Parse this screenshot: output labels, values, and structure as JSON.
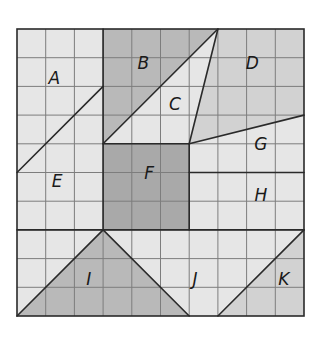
{
  "figure": {
    "grid": {
      "cols": 10,
      "rows": 10,
      "origin_px": [
        17,
        29
      ],
      "cell_px": 28.7
    },
    "colors": {
      "background": "#ffffff",
      "light": "#e6e6e6",
      "medium": "#d2d2d2",
      "dark": "#b9b9b9",
      "darkest": "#a9a9a9",
      "gridline": "#7d7d7d",
      "boundary": "#2a2a2a"
    },
    "regions": [
      {
        "label": "A",
        "shade": "light",
        "points": [
          [
            0,
            0
          ],
          [
            3,
            0
          ],
          [
            3,
            2
          ],
          [
            0,
            5
          ]
        ],
        "label_pos": [
          1.3,
          1.7
        ]
      },
      {
        "label": "B",
        "shade": "dark",
        "points": [
          [
            3,
            0
          ],
          [
            7,
            0
          ],
          [
            3,
            4
          ]
        ],
        "label_pos": [
          4.4,
          1.2
        ]
      },
      {
        "label": "C",
        "shade": "light",
        "points": [
          [
            7,
            0
          ],
          [
            6,
            4
          ],
          [
            3,
            4
          ]
        ],
        "label_pos": [
          5.5,
          2.6
        ]
      },
      {
        "label": "D",
        "shade": "medium",
        "points": [
          [
            7,
            0
          ],
          [
            10,
            0
          ],
          [
            10,
            3
          ],
          [
            6,
            4
          ]
        ],
        "label_pos": [
          8.2,
          1.2
        ]
      },
      {
        "label": "E",
        "shade": "light",
        "points": [
          [
            0,
            5
          ],
          [
            3,
            2
          ],
          [
            3,
            7
          ],
          [
            0,
            7
          ]
        ],
        "label_pos": [
          1.4,
          5.3
        ]
      },
      {
        "label": "F",
        "shade": "darkest",
        "points": [
          [
            3,
            4
          ],
          [
            6,
            4
          ],
          [
            6,
            7
          ],
          [
            3,
            7
          ]
        ],
        "label_pos": [
          4.6,
          5.0
        ]
      },
      {
        "label": "G",
        "shade": "light",
        "points": [
          [
            6,
            4
          ],
          [
            10,
            3
          ],
          [
            10,
            5
          ],
          [
            6,
            5
          ]
        ],
        "label_pos": [
          8.5,
          4.0
        ]
      },
      {
        "label": "H",
        "shade": "light",
        "points": [
          [
            6,
            5
          ],
          [
            10,
            5
          ],
          [
            10,
            7
          ],
          [
            6,
            7
          ]
        ],
        "label_pos": [
          8.5,
          5.8
        ]
      },
      {
        "label": "I",
        "shade": "dark",
        "points": [
          [
            0,
            10
          ],
          [
            3,
            7
          ],
          [
            6,
            10
          ]
        ],
        "label_pos": [
          2.5,
          8.7
        ]
      },
      {
        "label": "J",
        "shade": "light",
        "points": [
          [
            0,
            7
          ],
          [
            10,
            7
          ],
          [
            7,
            10
          ],
          [
            6,
            10
          ],
          [
            3,
            7
          ],
          [
            0,
            10
          ]
        ],
        "label_pos": [
          6.2,
          8.7
        ]
      },
      {
        "label": "K",
        "shade": "medium",
        "points": [
          [
            10,
            7
          ],
          [
            10,
            10
          ],
          [
            7,
            10
          ]
        ],
        "label_pos": [
          9.3,
          8.7
        ]
      }
    ],
    "boundary_lines": [
      [
        [
          0,
          5
        ],
        [
          3,
          2
        ]
      ],
      [
        [
          3,
          4
        ],
        [
          7,
          0
        ]
      ],
      [
        [
          7,
          0
        ],
        [
          6,
          4
        ]
      ],
      [
        [
          6,
          4
        ],
        [
          10,
          3
        ]
      ],
      [
        [
          3,
          0
        ],
        [
          3,
          7
        ]
      ],
      [
        [
          3,
          4
        ],
        [
          6,
          4
        ]
      ],
      [
        [
          6,
          4
        ],
        [
          6,
          7
        ]
      ],
      [
        [
          6,
          5
        ],
        [
          10,
          5
        ]
      ],
      [
        [
          0,
          7
        ],
        [
          10,
          7
        ]
      ],
      [
        [
          0,
          10
        ],
        [
          3,
          7
        ]
      ],
      [
        [
          3,
          7
        ],
        [
          6,
          10
        ]
      ],
      [
        [
          7,
          10
        ],
        [
          10,
          7
        ]
      ]
    ]
  }
}
